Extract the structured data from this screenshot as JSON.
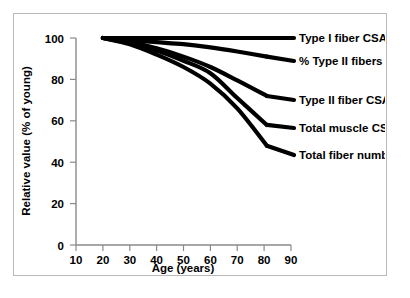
{
  "chart_data": {
    "type": "line",
    "title": "",
    "xlabel": "Age (years)",
    "ylabel": "Relative value (% of young)",
    "xlim": [
      10,
      90
    ],
    "ylim": [
      0,
      100
    ],
    "xticks": [
      10,
      20,
      30,
      40,
      50,
      60,
      70,
      80,
      90
    ],
    "yticks": [
      0,
      20,
      40,
      60,
      80,
      100
    ],
    "xtick_labels": [
      "10",
      "20",
      "30",
      "40",
      "50",
      "60",
      "70",
      "80",
      "90"
    ],
    "ytick_labels": [
      "0",
      "20",
      "40",
      "60",
      "80",
      "100"
    ],
    "grid": false,
    "legend_position": "right-inline-labels",
    "x": [
      20,
      30,
      40,
      50,
      60,
      70,
      81
    ],
    "series": [
      {
        "name": "Type I fiber CSA",
        "label": "Type I  fiber CSA",
        "values": [
          100,
          100,
          100,
          100,
          100,
          100,
          100
        ],
        "color": "#000000"
      },
      {
        "name": "% Type II fibers",
        "label": "%  Type II  fibers",
        "values": [
          100,
          99,
          98,
          97,
          95.5,
          93.5,
          91
        ],
        "color": "#000000"
      },
      {
        "name": "Type II fiber CSA",
        "label": "Type II  fiber CSA",
        "values": [
          100,
          98,
          95,
          91,
          86,
          79.5,
          72
        ],
        "color": "#000000"
      },
      {
        "name": "Total muscle CSA",
        "label": "Total muscle CSA",
        "values": [
          100,
          97.5,
          94,
          89,
          83,
          71,
          58
        ],
        "color": "#000000"
      },
      {
        "name": "Total fiber number",
        "label": "Total  fiber number",
        "values": [
          100,
          97,
          92,
          86,
          78,
          66,
          48
        ],
        "color": "#000000"
      }
    ]
  },
  "axes": {
    "x_title": "Age (years)",
    "y_title": "Relative value (% of young)"
  },
  "labels": {
    "type_i_fiber_csa": "Type I  fiber CSA",
    "pct_type_ii_fibers": "%  Type II  fibers",
    "type_ii_fiber_csa": "Type II  fiber CSA",
    "total_muscle_csa": "Total muscle CSA",
    "total_fiber_number": "Total  fiber number"
  },
  "ticks": {
    "x": [
      "10",
      "20",
      "30",
      "40",
      "50",
      "60",
      "70",
      "80",
      "90"
    ],
    "y": [
      "0",
      "20",
      "40",
      "60",
      "80",
      "100"
    ]
  },
  "colors": {
    "curve": "#000000",
    "axis": "#8a8a8a",
    "frame": "#b9b9b9",
    "background": "#ffffff"
  }
}
